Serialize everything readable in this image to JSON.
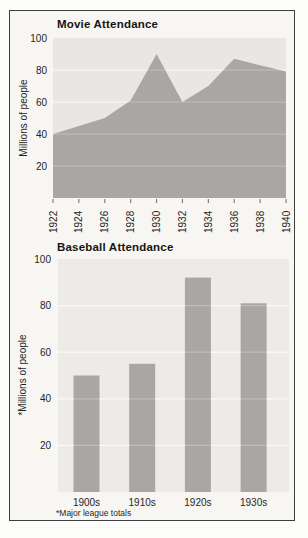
{
  "page": {
    "background_color": "#fdfdfc",
    "frame_border_color": "#3f3f3f",
    "frame_background_color": "#f7f6f3",
    "text_color": "#1f1f1f"
  },
  "chart_data": [
    {
      "type": "area",
      "title": "Movie Attendance",
      "ylabel": "Millions of people",
      "x": [
        1922,
        1924,
        1926,
        1928,
        1930,
        1932,
        1934,
        1936,
        1938,
        1940
      ],
      "values": [
        40,
        45,
        50,
        61,
        90,
        60,
        70,
        87,
        83,
        79
      ],
      "ylim": [
        0,
        100
      ],
      "yticks": [
        20,
        40,
        60,
        80,
        100
      ],
      "grid": true,
      "legend": "none",
      "fill_color": "#a8a7a4",
      "plot_background": "#e9e7e3",
      "grid_color": "#f7f6f4"
    },
    {
      "type": "bar",
      "title": "Baseball Attendance",
      "ylabel": "*Millions of people",
      "footnote": "*Major league totals",
      "categories": [
        "1900s",
        "1910s",
        "1920s",
        "1930s"
      ],
      "values": [
        50,
        55,
        92,
        81
      ],
      "ylim": [
        0,
        100
      ],
      "yticks": [
        20,
        40,
        60,
        80,
        100
      ],
      "grid": true,
      "legend": "none",
      "bar_color": "#a8a7a4",
      "plot_background": "#edebe7",
      "grid_color": "#f8f7f4"
    }
  ]
}
